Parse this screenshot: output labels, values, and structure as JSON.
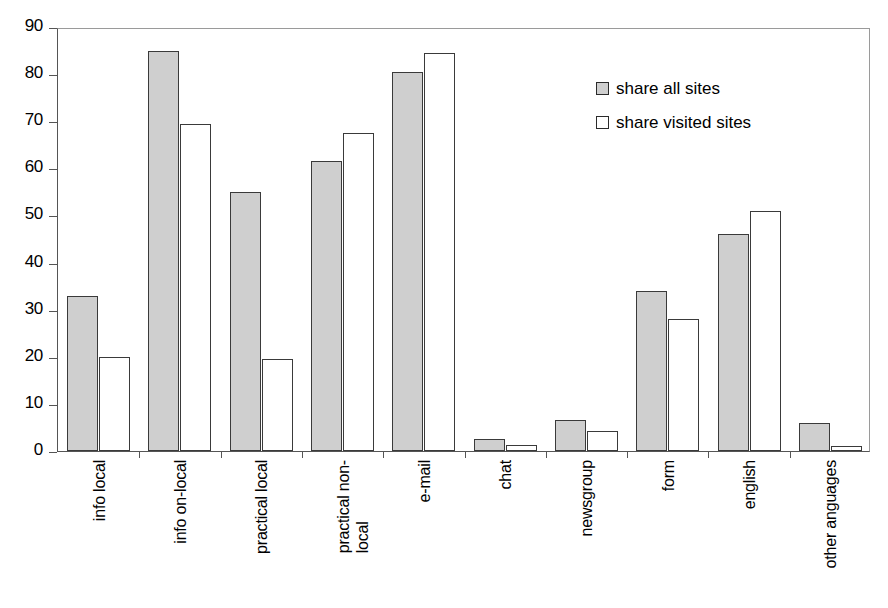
{
  "chart_data": {
    "type": "bar",
    "title": "",
    "xlabel": "",
    "ylabel": "",
    "ylim": [
      0,
      90
    ],
    "yticks": [
      0,
      10,
      20,
      30,
      40,
      50,
      60,
      70,
      80,
      90
    ],
    "grid": false,
    "legend_position": "inside-top-right",
    "categories": [
      "info local",
      "info on-local",
      "practical local",
      "practical non-\nlocal",
      "e-mail",
      "chat",
      "newsgroup",
      "form",
      "english",
      "other anguages"
    ],
    "category_lines": [
      [
        "info local"
      ],
      [
        "info on-local"
      ],
      [
        "practical local"
      ],
      [
        "practical non-",
        "local"
      ],
      [
        "e-mail"
      ],
      [
        "chat"
      ],
      [
        "newsgroup"
      ],
      [
        "form"
      ],
      [
        "english"
      ],
      [
        "other anguages"
      ]
    ],
    "series": [
      {
        "name": "share all sites",
        "color": "#cfcfcf",
        "values": [
          33,
          85,
          55,
          61.5,
          80.5,
          2.5,
          6.5,
          34,
          46,
          6
        ]
      },
      {
        "name": "share visited sites",
        "color": "#ffffff",
        "values": [
          20,
          69.5,
          19.5,
          67.5,
          84.5,
          1.3,
          4.3,
          28,
          51,
          1
        ]
      }
    ]
  },
  "legend": {
    "items": [
      {
        "label": "share all sites",
        "swatch": "gray"
      },
      {
        "label": "share visited sites",
        "swatch": "white"
      }
    ]
  }
}
